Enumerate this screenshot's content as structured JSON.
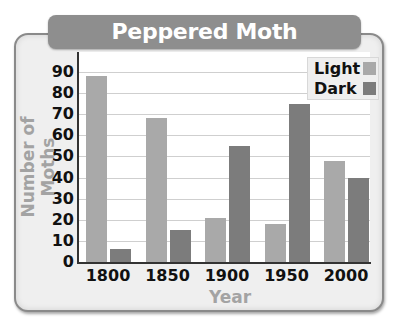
{
  "chart_data": {
    "type": "bar",
    "title": "Peppered Moth Populations",
    "xlabel": "Year",
    "ylabel": "Number of Moths",
    "categories": [
      "1800",
      "1850",
      "1900",
      "1950",
      "2000"
    ],
    "series": [
      {
        "name": "Light",
        "color": "#a9a9a9",
        "values": [
          88,
          68,
          21,
          18,
          48
        ]
      },
      {
        "name": "Dark",
        "color": "#7c7c7c",
        "values": [
          6,
          15,
          55,
          75,
          40
        ]
      }
    ],
    "ylim": [
      0,
      90
    ],
    "yticks": [
      "0",
      "10",
      "20",
      "30",
      "40",
      "50",
      "60",
      "70",
      "80",
      "90"
    ],
    "grid": true,
    "legend_position": "top-right"
  }
}
